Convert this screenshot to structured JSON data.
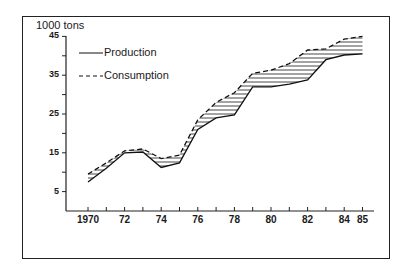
{
  "chart_data": {
    "type": "line",
    "title": "",
    "ylabel": "1000 tons",
    "xlabel": "",
    "ylim": [
      0,
      45
    ],
    "xlim": [
      1970,
      1985
    ],
    "grid": false,
    "legend_position": "top-left (inside)",
    "yticks": [
      "5",
      "15",
      "25",
      "35",
      "45"
    ],
    "xticks": [
      "1970",
      "72",
      "74",
      "76",
      "78",
      "80",
      "82",
      "84",
      "85"
    ],
    "x": [
      1970,
      1971,
      1972,
      1973,
      1974,
      1975,
      1976,
      1977,
      1978,
      1979,
      1980,
      1981,
      1982,
      1983,
      1984,
      1985
    ],
    "series": [
      {
        "name": "Production",
        "style": "solid",
        "values": [
          7.5,
          11,
          15,
          15.2,
          11.2,
          12.4,
          21,
          24,
          24.8,
          32,
          32,
          32.7,
          33.8,
          39,
          40.2,
          40.5
        ]
      },
      {
        "name": "Consumption",
        "style": "dashed",
        "values": [
          9.5,
          12.4,
          15.5,
          16,
          13.5,
          14.4,
          23.5,
          28,
          30.5,
          35.5,
          36.3,
          38,
          41.5,
          41.8,
          44.3,
          45
        ]
      }
    ],
    "annotations": [
      "Hatched area between curves marks consumption exceeding production"
    ]
  },
  "legend": {
    "production": "Production",
    "consumption": "Consumption"
  },
  "axis": {
    "unit_label": "1000 tons"
  }
}
